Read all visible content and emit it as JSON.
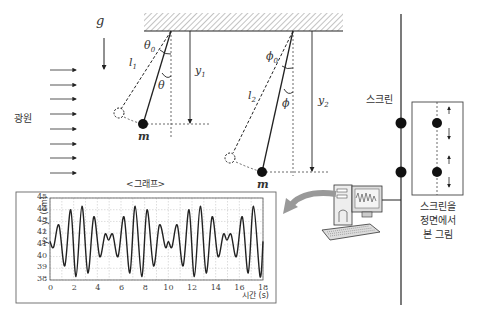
{
  "labels": {
    "gravity": "g",
    "light_source": "광원",
    "screen": "스크린",
    "front_view": [
      "스크린을",
      "정면에서",
      "본 그림"
    ],
    "graph_title": "<그래프>",
    "pendulum1": {
      "length": "l",
      "length_sub": "1",
      "theta0": "θ",
      "theta0_sub": "0",
      "theta": "θ",
      "height": "y",
      "height_sub": "1",
      "mass": "m"
    },
    "pendulum2": {
      "length": "l",
      "length_sub": "2",
      "phi0": "ϕ",
      "phi0_sub": "0",
      "phi": "ϕ",
      "height": "y",
      "height_sub": "2",
      "mass": "m"
    }
  },
  "colors": {
    "line": "#222222",
    "grid": "#bbbbbb",
    "arrow": "#999999",
    "hatch": "#888888"
  },
  "chart_data": {
    "type": "line",
    "title": "<그래프>",
    "xlabel": "시간 (s)",
    "ylabel": "y₂ − y₁ (cm)",
    "xlim": [
      0,
      18
    ],
    "ylim": [
      38,
      45
    ],
    "xticks": [
      0,
      2,
      4,
      6,
      8,
      10,
      12,
      14,
      16,
      18
    ],
    "yticks": [
      38,
      39,
      40,
      41,
      42,
      43,
      44,
      45
    ],
    "grid": true,
    "series": [
      {
        "name": "y2 - y1",
        "x": [
          0,
          0.3,
          0.75,
          1.25,
          1.75,
          2.2,
          2.7,
          3.2,
          3.7,
          4.2,
          4.65,
          4.95,
          5.3,
          5.75,
          6.25,
          6.75,
          7.2,
          7.75,
          8.2,
          8.75,
          9.25,
          9.75,
          10.0,
          10.3,
          10.75,
          11.25,
          11.75,
          12.2,
          12.7,
          13.2,
          13.7,
          14.2,
          14.65,
          14.95,
          15.3,
          15.75,
          16.25,
          16.75,
          17.2,
          17.75,
          18.0
        ],
        "y": [
          41.3,
          40.8,
          42.7,
          39.2,
          44.0,
          38.3,
          44.3,
          38.6,
          43.4,
          40.0,
          41.9,
          41.4,
          41.9,
          40.0,
          43.4,
          38.6,
          44.3,
          38.3,
          44.0,
          39.2,
          42.7,
          40.8,
          41.3,
          40.8,
          42.7,
          39.2,
          44.0,
          38.3,
          44.3,
          38.6,
          43.4,
          40.0,
          41.9,
          41.4,
          41.9,
          40.0,
          43.4,
          38.6,
          44.3,
          38.3,
          41.3
        ]
      }
    ]
  }
}
